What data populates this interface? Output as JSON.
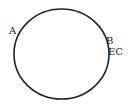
{
  "diagram": {
    "shape": "circle",
    "stroke_color": "#222222",
    "background": "#ffffff",
    "labels": {
      "a": "A",
      "b": "B",
      "ec": "EC"
    }
  }
}
